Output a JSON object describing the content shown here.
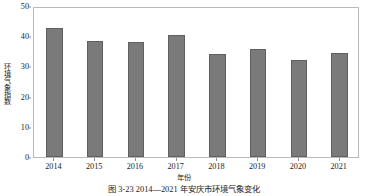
{
  "chart_data": {
    "type": "bar",
    "title": "",
    "xlabel": "年份",
    "ylabel": "环境气象指数",
    "categories": [
      "2014",
      "2015",
      "2016",
      "2017",
      "2018",
      "2019",
      "2020",
      "2021"
    ],
    "values": [
      42.7,
      38.5,
      38.2,
      40.3,
      34.2,
      35.8,
      32.0,
      34.5
    ],
    "series": [
      {
        "name": "环境气象指数",
        "values": [
          42.7,
          38.5,
          38.2,
          40.3,
          34.2,
          35.8,
          32.0,
          34.5
        ]
      }
    ],
    "ylim": [
      0,
      50
    ],
    "yticks": [
      0,
      10,
      20,
      30,
      40,
      50
    ],
    "ytick_labels": [
      "0",
      "10",
      "20",
      "30",
      "40",
      "50"
    ],
    "grid": false,
    "legend": false,
    "legend_position": "none",
    "bar_color": "#7a7a7a",
    "bar_edge_color": "#5f5f5f",
    "frame_color": "#b9b9b9",
    "text_color": "#1c1c1c"
  },
  "caption": {
    "text": "图 3-23  2014—2021 年安庆市环境气象变化"
  }
}
